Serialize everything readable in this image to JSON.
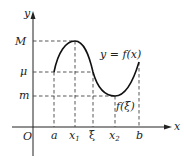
{
  "diagram": {
    "type": "function-graph",
    "axes": {
      "x_label": "x",
      "y_label": "y",
      "origin_label": "O"
    },
    "y_levels": [
      {
        "name": "M",
        "label": "M"
      },
      {
        "name": "mu",
        "label": "μ"
      },
      {
        "name": "m",
        "label": "m"
      }
    ],
    "x_ticks": [
      {
        "name": "a",
        "label": "a"
      },
      {
        "name": "x1",
        "label": "x",
        "sub": "1"
      },
      {
        "name": "xi",
        "label": "ξ"
      },
      {
        "name": "x2",
        "label": "x",
        "sub": "2"
      },
      {
        "name": "b",
        "label": "b"
      }
    ],
    "curve_label": "y = f(x)",
    "point_label": "f(ξ)",
    "colors": {
      "curve": "#111111",
      "axis": "#222222",
      "dashed": "#444444"
    }
  }
}
